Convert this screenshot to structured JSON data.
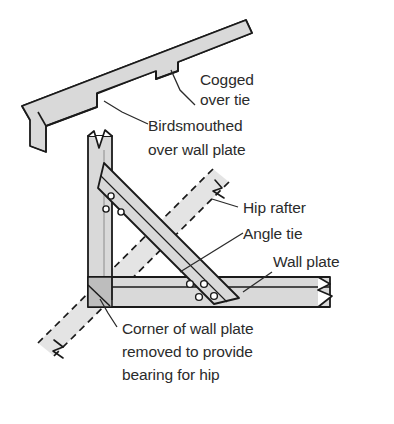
{
  "figure": {
    "type": "technical-line-drawing",
    "background_color": "#ffffff",
    "timber_fill_color": "#d9d9d9",
    "timber_fill_dark_color": "#bdbdbd",
    "outline_color": "#1a1a1a",
    "text_color": "#2b2b2b"
  },
  "labels": {
    "cogged_line1": "Cogged",
    "cogged_line2": "over tie",
    "birdsmouthed_line1": "Birdsmouthed",
    "birdsmouthed_line2": "over wall plate",
    "hip_rafter": "Hip rafter",
    "angle_tie": "Angle tie",
    "wall_plate": "Wall plate",
    "corner_line1": "Corner of wall plate",
    "corner_line2": "removed to provide",
    "corner_line3": "bearing for hip"
  },
  "parts": {
    "common_rafter": "common-rafter",
    "cog_notch": "cog-notch",
    "birdsmouth_notch": "birdsmouth-notch",
    "wall_plate_return": "wall-plate-return-leg",
    "wall_plate_run": "wall-plate-run-leg",
    "angle_tie": "angle-tie",
    "hip_rafter": "hip-rafter-dashed",
    "bearing_corner": "bearing-corner-cut",
    "bolt_holes_count": 6,
    "break_symbols": 4
  }
}
